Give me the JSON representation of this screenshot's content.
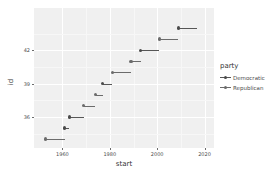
{
  "chart_data": {
    "type": "scatter",
    "title": "",
    "xlabel": "start",
    "ylabel": "id",
    "xlim": [
      1948,
      2024
    ],
    "ylim": [
      33.2,
      45.8
    ],
    "grid": true,
    "legend_position": "right",
    "x_ticks": [
      "1960",
      "1980",
      "2000",
      "2020"
    ],
    "x_tick_values": [
      1960,
      1980,
      2000,
      2020
    ],
    "y_ticks": [
      "36",
      "39",
      "42"
    ],
    "y_tick_values": [
      36,
      39,
      42
    ],
    "legend": {
      "title": "party",
      "entries": [
        {
          "label": "Democratic",
          "key": "democratic"
        },
        {
          "label": "Republican",
          "key": "republican"
        }
      ]
    },
    "colors": {
      "democratic": "#4a4a4a",
      "republican": "#6b6b6b",
      "panel_background": "#f0f0f0",
      "gridline": "#ffffff",
      "text": "#4d4d4d"
    },
    "series": [
      {
        "name": "Democratic",
        "party": "democratic"
      },
      {
        "name": "Republican",
        "party": "republican"
      }
    ],
    "points": [
      {
        "id": 34,
        "start": 1953,
        "end": 1961,
        "party": "republican"
      },
      {
        "id": 35,
        "start": 1961,
        "end": 1963,
        "party": "democratic"
      },
      {
        "id": 36,
        "start": 1963,
        "end": 1969,
        "party": "democratic"
      },
      {
        "id": 37,
        "start": 1969,
        "end": 1974,
        "party": "republican"
      },
      {
        "id": 38,
        "start": 1974,
        "end": 1977,
        "party": "republican"
      },
      {
        "id": 39,
        "start": 1977,
        "end": 1981,
        "party": "democratic"
      },
      {
        "id": 40,
        "start": 1981,
        "end": 1989,
        "party": "republican"
      },
      {
        "id": 41,
        "start": 1989,
        "end": 1993,
        "party": "republican"
      },
      {
        "id": 42,
        "start": 1993,
        "end": 2001,
        "party": "democratic"
      },
      {
        "id": 43,
        "start": 2001,
        "end": 2009,
        "party": "republican"
      },
      {
        "id": 44,
        "start": 2009,
        "end": 2017,
        "party": "democratic"
      }
    ]
  }
}
